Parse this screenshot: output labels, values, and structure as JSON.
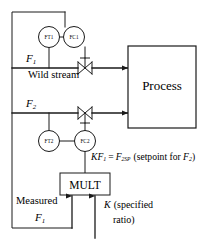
{
  "diagram": {
    "colors": {
      "line": "#1a1a1a",
      "background": "#ffffff",
      "text": "#000000"
    },
    "instruments": [
      {
        "id": "ft1",
        "label": "FT1",
        "meaning": "flow-transmitter-1"
      },
      {
        "id": "fc1",
        "label": "FC1",
        "meaning": "flow-controller-1"
      },
      {
        "id": "ft2",
        "label": "FT2",
        "meaning": "flow-transmitter-2"
      },
      {
        "id": "fc2",
        "label": "FC2",
        "meaning": "flow-controller-2"
      }
    ],
    "blocks": [
      {
        "id": "process",
        "label": "Process"
      },
      {
        "id": "mult",
        "label": "MULT"
      }
    ],
    "labels": {
      "stream1_symbol": "F",
      "stream1_sub": "1",
      "stream1_name": "Wild stream",
      "stream2_symbol": "F",
      "stream2_sub": "2",
      "measured": "Measured",
      "measured_symbol": "F",
      "measured_sub": "1",
      "equation_k": "K",
      "equation_f1": "F",
      "equation_f1_sub": "1",
      "equation_eq": "=",
      "equation_f2": "F",
      "equation_f2_sub": "2SP",
      "equation_note": "(setpoint for ",
      "equation_note_f2": "F",
      "equation_note_f2_sub": "2",
      "equation_note_close": ")",
      "ratio_k": "K",
      "ratio_text": "(specified",
      "ratio_text2": "ratio)"
    }
  }
}
